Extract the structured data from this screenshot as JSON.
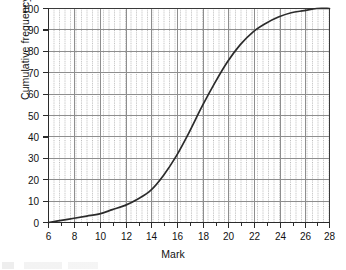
{
  "chart_data": {
    "type": "line",
    "title": "",
    "subtitle": "",
    "xlabel": "Mark",
    "ylabel": "Cumulative frequency %",
    "xlim": [
      6,
      28
    ],
    "ylim": [
      0,
      100
    ],
    "xticks": [
      6,
      8,
      10,
      12,
      14,
      16,
      18,
      20,
      22,
      24,
      26,
      28
    ],
    "yticks": [
      0,
      10,
      20,
      30,
      40,
      50,
      60,
      70,
      80,
      90,
      100
    ],
    "x_minor_step": 0.4,
    "y_minor_step": 2,
    "grid": true,
    "grid_style": "major solid gray, minor dotted gray",
    "legend": "none",
    "series": [
      {
        "name": "Cumulative frequency",
        "x": [
          6,
          7,
          8,
          9,
          10,
          11,
          12,
          13,
          14,
          15,
          16,
          17,
          18,
          19,
          20,
          21,
          22,
          23,
          24,
          25,
          26,
          27,
          28
        ],
        "values": [
          0,
          1,
          2,
          3,
          4,
          6,
          8,
          11,
          15,
          22,
          31,
          42,
          54,
          65,
          75,
          83,
          89,
          93,
          96,
          98,
          99,
          100,
          100
        ]
      }
    ],
    "annotations": []
  },
  "figure": {
    "xlabel": "Mark",
    "ylabel": "Cumulative frequency %",
    "xticks": [
      "6",
      "8",
      "10",
      "12",
      "14",
      "16",
      "18",
      "20",
      "22",
      "24",
      "26",
      "28"
    ],
    "yticks": [
      "0",
      "10",
      "20",
      "30",
      "40",
      "50",
      "60",
      "70",
      "80",
      "90",
      "100"
    ]
  },
  "colors": {
    "curve": "#2b2b2b",
    "axis": "#2b2b2b",
    "grid_major": "#8a8a8a",
    "grid_minor": "#b5b5b5",
    "background": "#ffffff",
    "text": "#121212"
  }
}
